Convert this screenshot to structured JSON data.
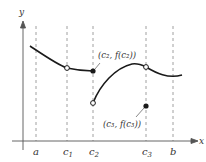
{
  "diagram": {
    "type": "function-graph-discontinuities",
    "axes": {
      "x_label": "x",
      "y_label": "y"
    },
    "tick_labels": [
      {
        "id": "a",
        "text": "a",
        "sub": ""
      },
      {
        "id": "c1",
        "text": "c",
        "sub": "1"
      },
      {
        "id": "c2",
        "text": "c",
        "sub": "2"
      },
      {
        "id": "c3",
        "text": "c",
        "sub": "3"
      },
      {
        "id": "b",
        "text": "b",
        "sub": ""
      }
    ],
    "annotations": [
      {
        "id": "c2-point",
        "text": "(c₂, f(c₂))"
      },
      {
        "id": "c3-point",
        "text": "(c₃, f(c₃))"
      }
    ],
    "colors": {
      "curve": "#1a1a1a",
      "axis": "#555555",
      "dash": "#888888"
    }
  }
}
